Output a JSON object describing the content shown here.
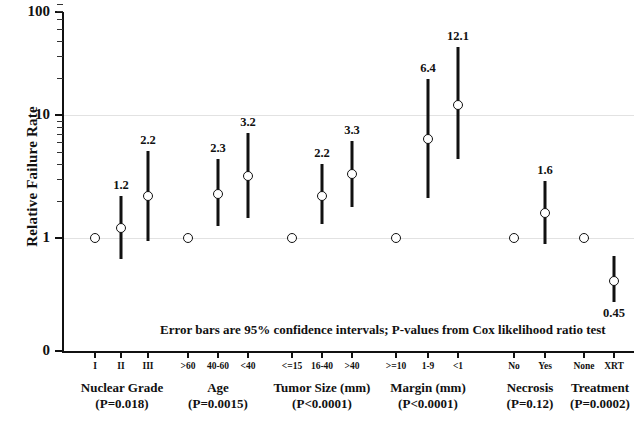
{
  "chart_data": {
    "type": "scatter",
    "title": "",
    "xlabel": "",
    "ylabel": "Relative Failure Rate",
    "yscale": "log",
    "ylim": [
      1,
      100
    ],
    "ytick_labels": [
      "100",
      "10",
      "1",
      "0"
    ],
    "ytick_values": [
      100,
      10,
      1,
      0
    ],
    "grid": true,
    "annotation": "Error bars are 95% confidence intervals;  P-values from Cox likelihood ratio test",
    "groups": [
      {
        "name": "Nuclear Grade",
        "pvalue": "(P=0.018)",
        "categories": [
          "I",
          "II",
          "III"
        ],
        "values": [
          1.0,
          1.2,
          2.2
        ],
        "labels": [
          "",
          "1.2",
          "2.2"
        ],
        "ci_low": [
          null,
          0.68,
          0.95
        ],
        "ci_high": [
          null,
          2.2,
          5.1
        ],
        "reference_index": 0
      },
      {
        "name": "Age",
        "pvalue": "(P=0.0015)",
        "categories": [
          ">60",
          "40-60",
          "<40"
        ],
        "values": [
          1.0,
          2.3,
          3.2
        ],
        "labels": [
          "",
          "2.3",
          "3.2"
        ],
        "ci_low": [
          null,
          1.25,
          1.45
        ],
        "ci_high": [
          null,
          4.4,
          7.2
        ],
        "reference_index": 0
      },
      {
        "name": "Tumor Size (mm)",
        "pvalue": "(P<0.0001)",
        "categories": [
          "<=15",
          "16-40",
          ">40"
        ],
        "values": [
          1.0,
          2.2,
          3.3
        ],
        "labels": [
          "",
          "2.2",
          "3.3"
        ],
        "ci_low": [
          null,
          1.3,
          1.8
        ],
        "ci_high": [
          null,
          4.0,
          6.2
        ],
        "reference_index": 0
      },
      {
        "name": "Margin (mm)",
        "pvalue": "(P<0.0001)",
        "categories": [
          ">=10",
          "1-9",
          "<1"
        ],
        "values": [
          1.0,
          6.4,
          12.1
        ],
        "labels": [
          "",
          "6.4",
          "12.1"
        ],
        "ci_low": [
          null,
          2.1,
          4.4
        ],
        "ci_high": [
          null,
          19.5,
          36.0
        ],
        "reference_index": 0
      },
      {
        "name": "Necrosis",
        "pvalue": "(P=0.12)",
        "categories": [
          "No",
          "Yes"
        ],
        "values": [
          1.0,
          1.6
        ],
        "labels": [
          "",
          "1.6"
        ],
        "ci_low": [
          null,
          0.9
        ],
        "ci_high": [
          null,
          2.9
        ],
        "reference_index": 0
      },
      {
        "name": "Treatment",
        "pvalue": "(P=0.0002)",
        "categories": [
          "None",
          "XRT"
        ],
        "values": [
          1.0,
          0.45
        ],
        "labels": [
          "",
          "0.45"
        ],
        "ci_low": [
          null,
          0.3
        ],
        "ci_high": [
          null,
          0.72
        ],
        "reference_index": 0
      }
    ]
  },
  "axes": {
    "y_title": "Relative Failure Rate",
    "y_labels": [
      "100",
      "10",
      "1",
      "0"
    ]
  },
  "footnote": {
    "text": "Error bars are 95% confidence intervals;  P-values from Cox likelihood ratio test"
  },
  "groups_display": [
    {
      "name": "Nuclear Grade",
      "pvalue": "(P=0.018)"
    },
    {
      "name": "Age",
      "pvalue": "(P=0.0015)"
    },
    {
      "name": "Tumor Size (mm)",
      "pvalue": "(P<0.0001)"
    },
    {
      "name": "Margin (mm)",
      "pvalue": "(P<0.0001)"
    },
    {
      "name": "Necrosis",
      "pvalue": "(P=0.12)"
    },
    {
      "name": "Treatment",
      "pvalue": "(P=0.0002)"
    }
  ]
}
